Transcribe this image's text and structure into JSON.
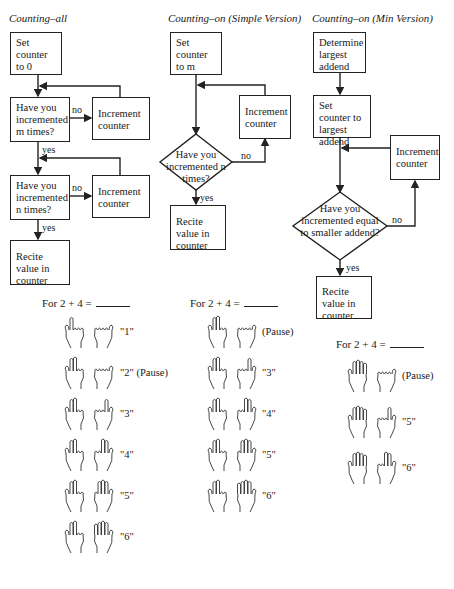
{
  "columns": [
    {
      "title": "Counting–all",
      "boxes": {
        "start": "Set counter to 0",
        "decision1": "Have you incremented m times?",
        "inc1": "Increment counter",
        "decision2": "Have you incremented n times?",
        "inc2": "Increment counter",
        "end": "Recite value in counter"
      },
      "labels": {
        "no1": "no",
        "yes1": "yes",
        "no2": "no",
        "yes2": "yes"
      },
      "problem": "For 2 + 4 =",
      "steps": [
        {
          "left": 1,
          "right": 0,
          "say": "\"1\""
        },
        {
          "left": 2,
          "right": 0,
          "say": "\"2\" (Pause)"
        },
        {
          "left": 2,
          "right": 1,
          "say": "\"3\""
        },
        {
          "left": 2,
          "right": 2,
          "say": "\"4\""
        },
        {
          "left": 2,
          "right": 3,
          "say": "\"5\""
        },
        {
          "left": 2,
          "right": 4,
          "say": "\"6\""
        }
      ]
    },
    {
      "title": "Counting–on (Simple Version)",
      "boxes": {
        "start": "Set counter to m",
        "inc": "Increment counter",
        "decision": "Have you incremented n times?",
        "end": "Recite value in counter"
      },
      "labels": {
        "no": "no",
        "yes": "yes"
      },
      "problem": "For 2 + 4 =",
      "steps": [
        {
          "left": 2,
          "right": 0,
          "say": "(Pause)"
        },
        {
          "left": 2,
          "right": 1,
          "say": "\"3\""
        },
        {
          "left": 2,
          "right": 2,
          "say": "\"4\""
        },
        {
          "left": 2,
          "right": 3,
          "say": "\"5\""
        },
        {
          "left": 2,
          "right": 4,
          "say": "\"6\""
        }
      ]
    },
    {
      "title": "Counting–on (Min Version)",
      "boxes": {
        "determine": "Determine largest addend",
        "start": "Set counter to largest addend",
        "inc": "Increment counter",
        "decision": "Have you incremented equal to smaller addend?",
        "end": "Recite value in counter"
      },
      "labels": {
        "no": "no",
        "yes": "yes"
      },
      "problem": "For 2 + 4 =",
      "steps": [
        {
          "left": 4,
          "right": 0,
          "say": "(Pause)"
        },
        {
          "left": 4,
          "right": 1,
          "say": "\"5\""
        },
        {
          "left": 4,
          "right": 2,
          "say": "\"6\""
        }
      ]
    }
  ]
}
